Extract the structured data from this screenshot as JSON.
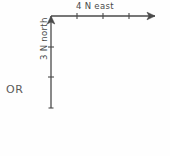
{
  "diagram": {
    "type": "vector-diagram",
    "title": "",
    "background_color": "#fefefe",
    "stroke_color": "#4a4a4a",
    "text_color": "#4a4a4a",
    "alternative_marker": "OR",
    "vectors": [
      {
        "name": "east-vector",
        "label": "4 N east",
        "magnitude": 4,
        "unit": "N",
        "direction": "east",
        "orientation": "horizontal",
        "arrowhead": "right",
        "tick_count": 3,
        "segments": 4,
        "label_position": "above"
      },
      {
        "name": "north-vector",
        "label": "3 N north",
        "magnitude": 3,
        "unit": "N",
        "direction": "north",
        "orientation": "vertical",
        "arrowhead": "up",
        "tick_count": 2,
        "segments": 3,
        "label_position": "right-rotated"
      }
    ]
  }
}
